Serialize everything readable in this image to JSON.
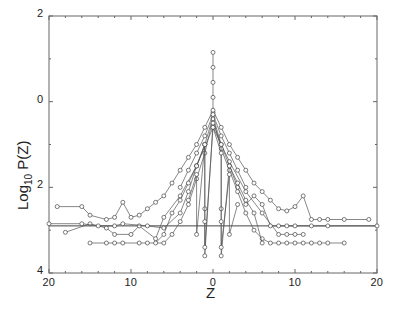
{
  "chart_data": {
    "type": "line",
    "title": "",
    "xlabel": "Z",
    "ylabel_main": "Log",
    "ylabel_sub": "10",
    "ylabel_tail": " P(Z)",
    "xlim": [
      -20,
      20
    ],
    "ylim": [
      -4,
      2
    ],
    "x_ticks": [
      {
        "value": -20,
        "label": "20"
      },
      {
        "value": -10,
        "label": "10"
      },
      {
        "value": 0,
        "label": "0"
      },
      {
        "value": 10,
        "label": "10"
      },
      {
        "value": 20,
        "label": "20"
      }
    ],
    "y_ticks": [
      {
        "value": 2,
        "label": "2"
      },
      {
        "value": 0,
        "label": "0"
      },
      {
        "value": -2,
        "label": "2"
      },
      {
        "value": -4,
        "label": "4"
      }
    ],
    "grid": false,
    "legend": null,
    "marker": "open-circle",
    "line_color": "#555555",
    "series": [
      {
        "name": "s1",
        "x": [
          0,
          0,
          0,
          0,
          0
        ],
        "y": [
          1.15,
          0.8,
          0.45,
          0.1,
          -0.25
        ]
      },
      {
        "name": "s2",
        "x": [
          -19,
          -16,
          -15,
          -13,
          -12,
          -11,
          -10,
          -9,
          -8,
          -7,
          -6,
          -5,
          -4,
          -3,
          -2,
          -1,
          0,
          1,
          2,
          3,
          4,
          5,
          6,
          7,
          8,
          9,
          10,
          11,
          12,
          13,
          14,
          16,
          19
        ],
        "y": [
          -2.45,
          -2.45,
          -2.65,
          -2.75,
          -2.7,
          -2.35,
          -2.7,
          -2.65,
          -2.5,
          -2.35,
          -2.2,
          -1.9,
          -1.6,
          -1.3,
          -1.0,
          -0.6,
          -0.2,
          -0.6,
          -1.0,
          -1.3,
          -1.6,
          -1.9,
          -2.1,
          -2.3,
          -2.5,
          -2.55,
          -2.45,
          -2.2,
          -2.75,
          -2.75,
          -2.75,
          -2.75,
          -2.75
        ]
      },
      {
        "name": "s3",
        "x": [
          -18,
          -15,
          -13,
          -12,
          -10,
          -9,
          -7,
          -6,
          -4,
          -2,
          0,
          2,
          4,
          6,
          8,
          9,
          10,
          11
        ],
        "y": [
          -3.05,
          -2.85,
          -2.95,
          -3.1,
          -3.1,
          -2.9,
          -3.2,
          -2.7,
          -2.2,
          -1.5,
          -0.6,
          -1.4,
          -2.1,
          -2.6,
          -3.1,
          -3.1,
          -3.1,
          -3.1
        ]
      },
      {
        "name": "s4",
        "x": [
          -20,
          -16,
          -14,
          -12,
          -11,
          -8,
          -6,
          -4,
          -3,
          -2,
          -1,
          0,
          1,
          2,
          3,
          4,
          5,
          6,
          7,
          8,
          9,
          10,
          12,
          14,
          20
        ],
        "y": [
          -2.85,
          -2.85,
          -2.9,
          -2.9,
          -2.85,
          -2.9,
          -2.95,
          -2.6,
          -2.1,
          -1.5,
          -1.0,
          -0.35,
          -1.0,
          -1.5,
          -2.0,
          -2.4,
          -2.2,
          -2.4,
          -2.9,
          -2.9,
          -2.9,
          -2.9,
          -2.9,
          -2.9,
          -2.9
        ]
      },
      {
        "name": "s5",
        "x": [
          -15,
          -13,
          -12,
          -11,
          -9,
          -8,
          -6,
          -5,
          -4,
          -3,
          -2,
          -1,
          0,
          1,
          2,
          3,
          4,
          5,
          6,
          7,
          8,
          9,
          10,
          11,
          12,
          13,
          14,
          16
        ],
        "y": [
          -3.3,
          -3.3,
          -3.3,
          -3.3,
          -3.3,
          -3.3,
          -3.3,
          -3.1,
          -2.8,
          -2.4,
          -1.8,
          -1.2,
          -0.4,
          -1.1,
          -1.6,
          -2.1,
          -2.6,
          -3.0,
          -3.2,
          -3.3,
          -3.3,
          -3.3,
          -3.3,
          -3.3,
          -3.3,
          -3.3,
          -3.3,
          -3.3
        ]
      },
      {
        "name": "s6",
        "x": [
          -7,
          -6,
          -5,
          -4,
          -3,
          -2,
          -1,
          -1,
          -1,
          0,
          1,
          1,
          1,
          2,
          3,
          4,
          5,
          6
        ],
        "y": [
          -3.3,
          -3.1,
          -2.6,
          -2.3,
          -1.9,
          -1.5,
          -1.0,
          -2.5,
          -3.6,
          -0.5,
          -1.0,
          -2.5,
          -3.6,
          -1.5,
          -1.9,
          -2.3,
          -2.6,
          -3.3
        ]
      },
      {
        "name": "s7",
        "x": [
          -3,
          -2,
          -2,
          -1,
          -1,
          -1,
          0,
          1,
          1,
          1,
          2,
          2,
          3
        ],
        "y": [
          -2.3,
          -1.7,
          -3.1,
          -1.0,
          -2.8,
          -3.4,
          -0.6,
          -1.2,
          -2.8,
          -3.4,
          -1.7,
          -3.1,
          -2.4
        ]
      },
      {
        "name": "s8",
        "x": [
          -4,
          -3,
          -2,
          -1,
          0,
          1,
          2,
          3,
          4
        ],
        "y": [
          -2.0,
          -1.6,
          -1.2,
          -0.8,
          -0.3,
          -0.8,
          -1.2,
          -1.6,
          -2.0
        ]
      }
    ]
  },
  "xlabel": "Z"
}
